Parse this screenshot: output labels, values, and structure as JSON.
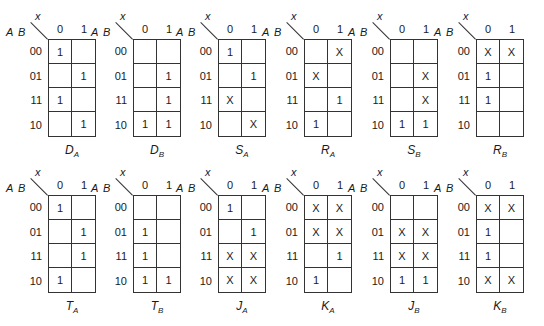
{
  "header": {
    "cut_text": "y(t+1)"
  },
  "axes": {
    "col_var": "x",
    "row_vars": "A B",
    "columns": [
      "0",
      "1"
    ],
    "rows": [
      "00",
      "01",
      "11",
      "10"
    ]
  },
  "maps": [
    {
      "name": "D",
      "sub": "A",
      "cells": [
        [
          "1",
          ""
        ],
        [
          "",
          "1"
        ],
        [
          "1",
          ""
        ],
        [
          "",
          "1"
        ]
      ]
    },
    {
      "name": "D",
      "sub": "B",
      "cells": [
        [
          "",
          ""
        ],
        [
          "",
          "1"
        ],
        [
          "",
          "1"
        ],
        [
          "1",
          "1"
        ]
      ]
    },
    {
      "name": "S",
      "sub": "A",
      "cells": [
        [
          "1",
          ""
        ],
        [
          "",
          "1"
        ],
        [
          "X",
          ""
        ],
        [
          "",
          "X"
        ]
      ]
    },
    {
      "name": "R",
      "sub": "A",
      "cells": [
        [
          "",
          "X"
        ],
        [
          "X",
          ""
        ],
        [
          "",
          "1"
        ],
        [
          "1",
          ""
        ]
      ]
    },
    {
      "name": "S",
      "sub": "B",
      "cells": [
        [
          "",
          ""
        ],
        [
          "",
          "X"
        ],
        [
          "",
          "X"
        ],
        [
          "1",
          "1"
        ]
      ]
    },
    {
      "name": "R",
      "sub": "B",
      "cells": [
        [
          "X",
          "X"
        ],
        [
          "1",
          ""
        ],
        [
          "1",
          ""
        ],
        [
          "",
          ""
        ]
      ]
    },
    {
      "name": "T",
      "sub": "A",
      "cells": [
        [
          "1",
          ""
        ],
        [
          "",
          "1"
        ],
        [
          "",
          "1"
        ],
        [
          "1",
          ""
        ]
      ]
    },
    {
      "name": "T",
      "sub": "B",
      "cells": [
        [
          "",
          ""
        ],
        [
          "1",
          ""
        ],
        [
          "1",
          ""
        ],
        [
          "1",
          "1"
        ]
      ]
    },
    {
      "name": "J",
      "sub": "A",
      "cells": [
        [
          "1",
          ""
        ],
        [
          "",
          "1"
        ],
        [
          "X",
          "X"
        ],
        [
          "X",
          "X"
        ]
      ]
    },
    {
      "name": "K",
      "sub": "A",
      "cells": [
        [
          "X",
          "X"
        ],
        [
          "X",
          "X"
        ],
        [
          "",
          "1"
        ],
        [
          "1",
          ""
        ]
      ]
    },
    {
      "name": "J",
      "sub": "B",
      "cells": [
        [
          "",
          ""
        ],
        [
          "X",
          "X"
        ],
        [
          "X",
          "X"
        ],
        [
          "1",
          "1"
        ]
      ]
    },
    {
      "name": "K",
      "sub": "B",
      "cells": [
        [
          "X",
          "X"
        ],
        [
          "1",
          ""
        ],
        [
          "1",
          ""
        ],
        [
          "X",
          "X"
        ]
      ]
    }
  ]
}
